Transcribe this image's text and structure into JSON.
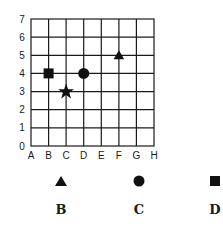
{
  "grid": {
    "x_labels": [
      "A",
      "B",
      "C",
      "D",
      "E",
      "F",
      "G",
      "H"
    ],
    "y_labels": [
      "0",
      "1",
      "2",
      "3",
      "4",
      "5",
      "6",
      "7"
    ],
    "points": [
      {
        "shape": "square",
        "x": "B",
        "y": 4
      },
      {
        "shape": "circle",
        "x": "D",
        "y": 4
      },
      {
        "shape": "star",
        "x": "C",
        "y": 3
      },
      {
        "shape": "triangle",
        "x": "F",
        "y": 5
      }
    ]
  },
  "options": [
    {
      "label": "B",
      "shape": "triangle-icon"
    },
    {
      "label": "C",
      "shape": "circle-icon"
    },
    {
      "label": "D",
      "shape": "square-icon"
    }
  ]
}
